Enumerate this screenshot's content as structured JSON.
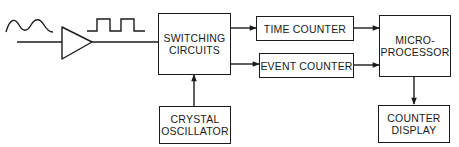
{
  "diagram": {
    "type": "block-diagram",
    "colors": {
      "line": "#1a1a1a",
      "background": "#ffffff"
    },
    "signals": {
      "input_waveform": "sine-wave",
      "conditioned_waveform": "square-wave"
    },
    "blocks": {
      "switching": {
        "label": "SWITCHING\nCIRCUITS"
      },
      "time_counter": {
        "label": "TIME COUNTER"
      },
      "event_counter": {
        "label": "EVENT COUNTER"
      },
      "microprocessor": {
        "label": "MICRO-\nPROCESSOR"
      },
      "crystal": {
        "label": "CRYSTAL\nOSCILLATOR"
      },
      "display": {
        "label": "COUNTER\nDISPLAY"
      }
    },
    "connections": [
      {
        "from": "input",
        "to": "amplifier"
      },
      {
        "from": "amplifier",
        "to": "switching"
      },
      {
        "from": "switching",
        "to": "time_counter"
      },
      {
        "from": "switching",
        "to": "event_counter"
      },
      {
        "from": "time_counter",
        "to": "microprocessor"
      },
      {
        "from": "event_counter",
        "to": "microprocessor"
      },
      {
        "from": "crystal",
        "to": "switching"
      },
      {
        "from": "microprocessor",
        "to": "display"
      }
    ]
  }
}
